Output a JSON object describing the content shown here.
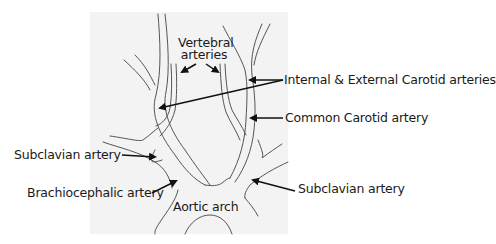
{
  "diagram": {
    "background_panel_color": "#f3f3f3",
    "line_color": "#555555",
    "arrow_color": "#111111",
    "labels": {
      "vertebral_line1": "Vertebral",
      "vertebral_line2": "arteries",
      "internal_external_carotid": "Internal & External Carotid arteries",
      "common_carotid": "Common Carotid artery",
      "subclavian_left": "Subclavian artery",
      "brachiocephalic": "Brachiocephalic artery",
      "subclavian_right": "Subclavian artery",
      "aortic_arch": "Aortic arch"
    }
  }
}
